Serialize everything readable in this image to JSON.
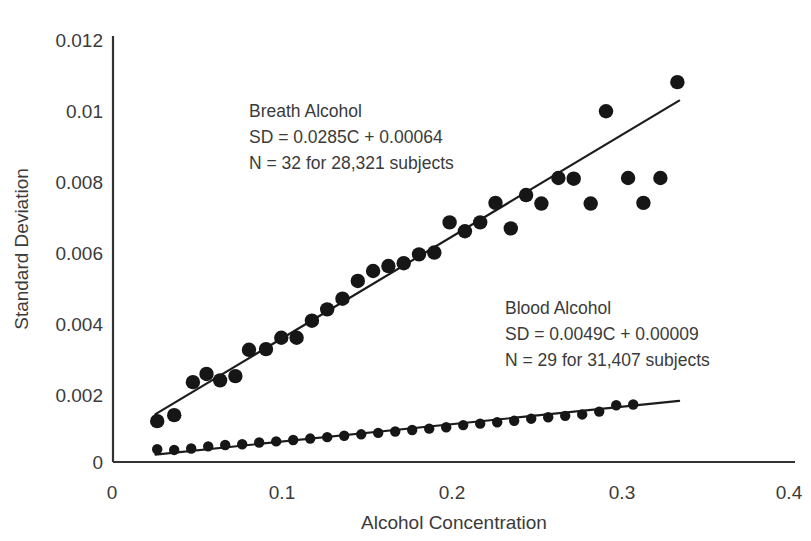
{
  "chart_data": {
    "type": "scatter",
    "title": "",
    "xlabel": "Alcohol Concentration",
    "ylabel": "Standard Deviation",
    "xlim": [
      0,
      0.4
    ],
    "ylim": [
      0,
      0.012
    ],
    "xticks": [
      "0",
      "0.1",
      "0.2",
      "0.3",
      "0.4"
    ],
    "xtick_values": [
      0,
      0.1,
      0.2,
      0.3,
      0.4
    ],
    "yticks": [
      "0",
      "0.002",
      "0.004",
      "0.006",
      "0.008",
      "0.01",
      "0.012"
    ],
    "ytick_values": [
      0,
      0.002,
      0.004,
      0.006,
      0.008,
      0.01,
      0.012
    ],
    "grid": false,
    "legend": "none",
    "marker_color": "#161616",
    "line_color": "#1c1c1c",
    "series": [
      {
        "name": "Breath Alcohol",
        "annotation_title": "Breath Alcohol",
        "annotation_equation": "SD = 0.0285C + 0.00064",
        "annotation_n": "N = 32 for 28,321 subjects",
        "slope": 0.0285,
        "intercept": 0.00064,
        "n_points": 32,
        "subjects": "28,321",
        "fit_x": [
          0.025,
          0.333
        ],
        "fit_y": [
          0.00135,
          0.01018
        ],
        "x": [
          0.026,
          0.036,
          0.047,
          0.055,
          0.063,
          0.072,
          0.08,
          0.09,
          0.099,
          0.108,
          0.117,
          0.126,
          0.135,
          0.144,
          0.153,
          0.162,
          0.171,
          0.18,
          0.189,
          0.198,
          0.207,
          0.216,
          0.225,
          0.234,
          0.243,
          0.252,
          0.262,
          0.271,
          0.281,
          0.29,
          0.303,
          0.312,
          0.322,
          0.332
        ],
        "y": [
          0.00115,
          0.00132,
          0.00225,
          0.00248,
          0.0023,
          0.00242,
          0.00316,
          0.00318,
          0.0035,
          0.0035,
          0.00398,
          0.0043,
          0.0046,
          0.0051,
          0.00538,
          0.00552,
          0.0056,
          0.00585,
          0.0059,
          0.00675,
          0.0065,
          0.00675,
          0.0073,
          0.00658,
          0.00752,
          0.00728,
          0.008,
          0.00798,
          0.00728,
          0.00988,
          0.008,
          0.0073,
          0.008,
          0.0107
        ]
      },
      {
        "name": "Blood Alcohol",
        "annotation_title": "Blood Alcohol",
        "annotation_equation": "SD = 0.0049C + 0.00009",
        "annotation_n": "N = 29 for 31,407 subjects",
        "slope": 0.0049,
        "intercept": 9e-05,
        "n_points": 29,
        "subjects": "31,407",
        "fit_x": [
          0.025,
          0.333
        ],
        "fit_y": [
          0.00021,
          0.00172
        ],
        "x": [
          0.026,
          0.036,
          0.046,
          0.056,
          0.066,
          0.076,
          0.086,
          0.096,
          0.106,
          0.116,
          0.126,
          0.136,
          0.146,
          0.156,
          0.166,
          0.176,
          0.186,
          0.196,
          0.206,
          0.216,
          0.226,
          0.236,
          0.246,
          0.256,
          0.266,
          0.276,
          0.286,
          0.296,
          0.306
        ],
        "y": [
          0.00036,
          0.00034,
          0.00038,
          0.00044,
          0.00048,
          0.0005,
          0.00055,
          0.00058,
          0.00062,
          0.00066,
          0.0007,
          0.00074,
          0.00078,
          0.00082,
          0.00086,
          0.0009,
          0.00094,
          0.00098,
          0.00104,
          0.00108,
          0.00112,
          0.00116,
          0.00122,
          0.00126,
          0.0013,
          0.00134,
          0.00142,
          0.0016,
          0.00162
        ]
      }
    ]
  },
  "annotations": {
    "breath": {
      "line1": "Breath Alcohol",
      "line2": "SD = 0.0285C + 0.00064",
      "line3": "N = 32 for 28,321 subjects"
    },
    "blood": {
      "line1": "Blood Alcohol",
      "line2": "SD = 0.0049C + 0.00009",
      "line3": "N = 29 for 31,407 subjects"
    }
  },
  "axes": {
    "x_title": "Alcohol Concentration",
    "y_title": "Standard Deviation",
    "x_tick_labels": [
      "0",
      "0.1",
      "0.2",
      "0.3",
      "0.4"
    ],
    "y_tick_labels": [
      "0.012",
      "0.01",
      "0.008",
      "0.006",
      "0.004",
      "0.002",
      "0"
    ]
  }
}
